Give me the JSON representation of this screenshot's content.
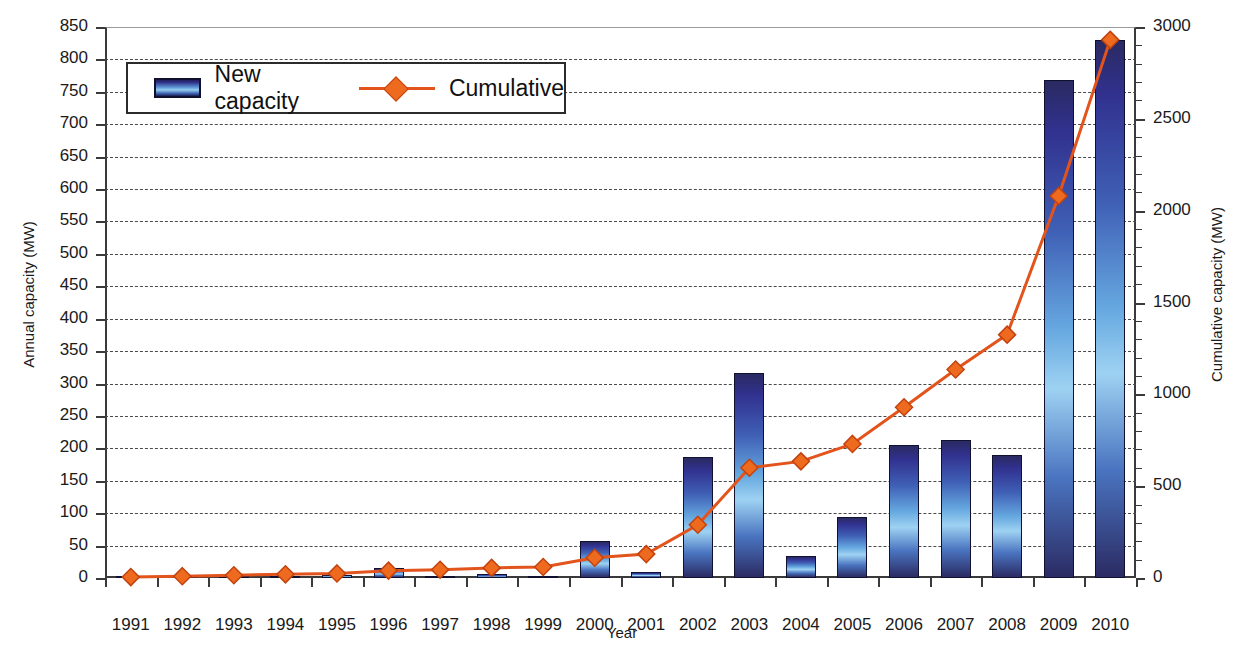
{
  "chart_data": {
    "type": "bar",
    "title": "",
    "xlabel": "Year",
    "ylabel": "Annual capacity (MW)",
    "y2label": "Cumulative capacity (MW)",
    "categories": [
      "1991",
      "1992",
      "1993",
      "1994",
      "1995",
      "1996",
      "1997",
      "1998",
      "1999",
      "2000",
      "2001",
      "2002",
      "2003",
      "2004",
      "2005",
      "2006",
      "2007",
      "2008",
      "2009",
      "2010"
    ],
    "series": [
      {
        "name": "New capacity",
        "type": "bar",
        "axis": "left",
        "color": "#3f6fbf",
        "values": [
          2,
          1,
          2,
          2,
          4,
          15,
          3,
          6,
          3,
          57,
          10,
          187,
          316,
          34,
          94,
          205,
          213,
          190,
          768,
          830
        ]
      },
      {
        "name": "Cumulative",
        "type": "line",
        "axis": "right",
        "color": "#E2541C",
        "marker": "diamond",
        "values": [
          5,
          10,
          15,
          20,
          25,
          40,
          45,
          55,
          60,
          110,
          130,
          290,
          600,
          635,
          730,
          930,
          1135,
          1325,
          2080,
          2930
        ]
      }
    ],
    "ylim": [
      0,
      850
    ],
    "ytick_step": 50,
    "yticks": [
      0,
      50,
      100,
      150,
      200,
      250,
      300,
      350,
      400,
      450,
      500,
      550,
      600,
      650,
      700,
      750,
      800,
      850
    ],
    "y2lim": [
      0,
      3000
    ],
    "y2tick_step": 500,
    "y2ticks": [
      0,
      500,
      1000,
      1500,
      2000,
      2500,
      3000
    ],
    "y2_minor_step": 100,
    "grid": true,
    "legend_position": "upper left"
  },
  "legend": {
    "bar_label": "New capacity",
    "line_label": "Cumulative"
  }
}
